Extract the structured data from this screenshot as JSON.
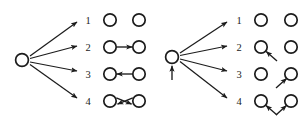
{
  "figure": {
    "type": "diagram",
    "background_color": "#ffffff",
    "ink_color": "#1c1c1c",
    "panels": [
      {
        "id": "left-panel",
        "name": "left-branching-diagram",
        "root": {
          "name": "left-root-node",
          "shape": "circle",
          "cx": 22,
          "cy": 60,
          "r": 6.4,
          "has_incoming_arrow": false
        },
        "branches": [
          {
            "label": "1",
            "from_x": 31,
            "from_y": 56,
            "to_x": 78,
            "to_y": 21
          },
          {
            "label": "2",
            "from_x": 31,
            "from_y": 58,
            "to_x": 78,
            "to_y": 45
          },
          {
            "label": "3",
            "from_x": 31,
            "from_y": 62,
            "to_x": 78,
            "to_y": 71
          },
          {
            "label": "4",
            "from_x": 31,
            "from_y": 65,
            "to_x": 78,
            "to_y": 98
          }
        ],
        "rows": [
          {
            "label": "1",
            "label_x": 88,
            "label_y": 24,
            "cy": 20,
            "left_cx": 110,
            "right_cx": 139,
            "edge": "none"
          },
          {
            "label": "2",
            "label_x": 88,
            "label_y": 51,
            "cy": 47,
            "left_cx": 110,
            "right_cx": 139,
            "edge": "arrow-right"
          },
          {
            "label": "3",
            "label_x": 88,
            "label_y": 78,
            "cy": 74,
            "left_cx": 110,
            "right_cx": 139,
            "edge": "arrow-left"
          },
          {
            "label": "4",
            "label_x": 88,
            "label_y": 105,
            "cy": 101,
            "left_cx": 110,
            "right_cx": 139,
            "edge": "bidirectional-crossed"
          }
        ]
      },
      {
        "id": "right-panel",
        "name": "right-branching-diagram",
        "root": {
          "name": "right-root-node",
          "shape": "circle",
          "cx": 172,
          "cy": 57,
          "r": 6.4,
          "has_incoming_arrow": true,
          "incoming_arrow_from_y": 80
        },
        "branches": [
          {
            "label": "1",
            "from_x": 181,
            "from_y": 53,
            "to_x": 228,
            "to_y": 21
          },
          {
            "label": "2",
            "from_x": 181,
            "from_y": 55,
            "to_x": 228,
            "to_y": 45
          },
          {
            "label": "3",
            "from_x": 181,
            "from_y": 59,
            "to_x": 228,
            "to_y": 71
          },
          {
            "label": "4",
            "from_x": 181,
            "from_y": 62,
            "to_x": 228,
            "to_y": 98
          }
        ],
        "rows": [
          {
            "label": "1",
            "label_x": 239,
            "label_y": 24,
            "cy": 20,
            "left_cx": 261,
            "right_cx": 291,
            "edge": "none"
          },
          {
            "label": "2",
            "label_x": 239,
            "label_y": 51,
            "cy": 47,
            "left_cx": 261,
            "right_cx": 291,
            "edge": "external-into-left"
          },
          {
            "label": "3",
            "label_x": 239,
            "label_y": 78,
            "cy": 74,
            "left_cx": 261,
            "right_cx": 291,
            "edge": "external-into-right"
          },
          {
            "label": "4",
            "label_x": 239,
            "label_y": 105,
            "cy": 101,
            "left_cx": 261,
            "right_cx": 291,
            "edge": "external-into-both"
          }
        ]
      }
    ]
  }
}
